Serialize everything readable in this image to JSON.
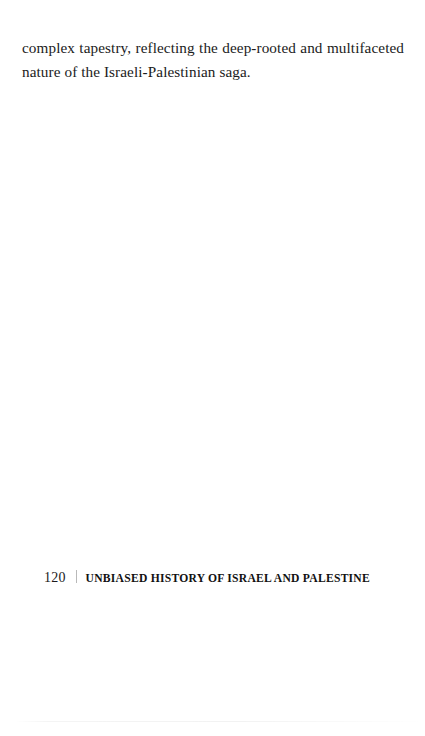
{
  "document": {
    "background_color": "#ffffff",
    "text_color": "#1b1b1b"
  },
  "content": {
    "paragraph": "complex tapestry, reflecting the deep-rooted and multifaceted nature of the Israeli-Palestinian saga."
  },
  "footer": {
    "page_number": "120",
    "running_title": "UNBIASED HISTORY OF ISRAEL AND PALESTINE",
    "divider_color": "#b9b9b9"
  }
}
